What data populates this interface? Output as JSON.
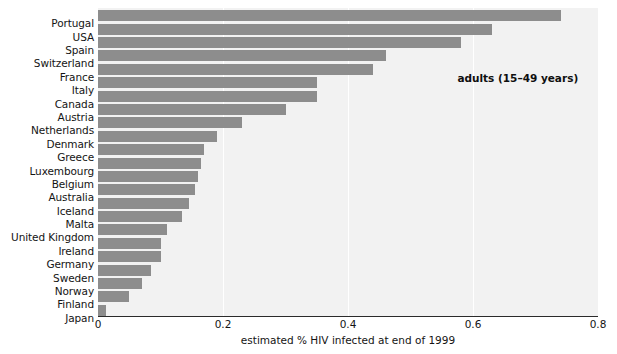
{
  "chart_data": {
    "type": "bar",
    "orientation": "horizontal",
    "title": "",
    "xlabel": "estimated % HIV infected at end of 1999",
    "ylabel": "",
    "xlim": [
      0,
      0.8
    ],
    "xticks": [
      "0",
      "0.2",
      "0.4",
      "0.6",
      "0.8"
    ],
    "xtick_values": [
      0,
      0.2,
      0.4,
      0.6,
      0.8
    ],
    "grid": "vertical",
    "legend": "none",
    "annotations": [
      "adults (15–49 years)"
    ],
    "categories": [
      "Portugal",
      "USA",
      "Spain",
      "Switzerland",
      "France",
      "Italy",
      "Canada",
      "Austria",
      "Netherlands",
      "Denmark",
      "Greece",
      "Luxembourg",
      "Belgium",
      "Australia",
      "Iceland",
      "Malta",
      "United Kingdom",
      "Ireland",
      "Germany",
      "Sweden",
      "Norway",
      "Finland",
      "Japan"
    ],
    "values": [
      0.74,
      0.63,
      0.58,
      0.46,
      0.44,
      0.35,
      0.35,
      0.3,
      0.23,
      0.19,
      0.17,
      0.165,
      0.16,
      0.155,
      0.145,
      0.135,
      0.11,
      0.1,
      0.1,
      0.085,
      0.07,
      0.05,
      0.012
    ],
    "colors": {
      "bar": "#8d8d8d",
      "plot_background": "#f2f2f2",
      "gridline": "#ffffff",
      "axis": "#2b2b2b",
      "text": "#141414"
    }
  },
  "annotation": {
    "text": "adults (15–49 years)"
  },
  "axis": {
    "x_title": "estimated % HIV infected at end of 1999"
  }
}
